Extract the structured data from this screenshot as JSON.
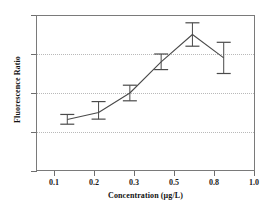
{
  "chart_data": {
    "type": "line",
    "title": "",
    "xlabel": "Concentration (µg/L)",
    "ylabel": "Fluorescence Ratio",
    "categories": [
      "0.1",
      "0.2",
      "0.3",
      "0.5",
      "0.8",
      "1.0"
    ],
    "x_numeric": [
      0.1,
      0.2,
      0.3,
      0.5,
      0.8,
      1.0
    ],
    "values": [
      1.32,
      1.5,
      2.0,
      2.8,
      3.5,
      2.9
    ],
    "error_low": [
      1.2,
      1.33,
      1.8,
      2.6,
      3.2,
      2.5
    ],
    "error_high": [
      1.45,
      1.78,
      2.2,
      3.0,
      3.8,
      3.3
    ],
    "error_minus": [
      0.12,
      0.17,
      0.2,
      0.2,
      0.3,
      0.4
    ],
    "error_plus": [
      0.13,
      0.28,
      0.2,
      0.2,
      0.3,
      0.4
    ],
    "ylim": [
      0,
      4
    ],
    "yticks": [
      "0",
      "1",
      "2",
      "3",
      "4"
    ],
    "ytick_values": [
      0,
      1,
      2,
      3,
      4
    ],
    "gridlines_y": [
      1,
      2,
      3
    ],
    "grid": "horizontal-dotted",
    "legend": "none",
    "marker": "none",
    "line_color": "#4a4a4a",
    "error_bar_color": "#4a4a4a",
    "grid_color": "#b9b9b9",
    "axis_color": "#7a7a7a",
    "text_color": "#111111",
    "background": "#ffffff",
    "series": [
      {
        "name": "Fluorescence Ratio",
        "values": [
          1.32,
          1.5,
          2.0,
          2.8,
          3.5,
          2.9
        ]
      }
    ]
  }
}
